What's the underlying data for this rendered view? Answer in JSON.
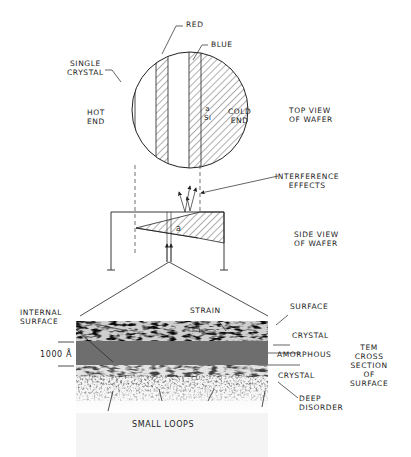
{
  "top_view": {
    "labels": {
      "red": "RED",
      "blue": "BLUE",
      "single_crystal": "SINGLE\nCRYSTAL",
      "hot_end": "HOT\nEND",
      "cold_end": "COLD\nEND",
      "alpha_si": "a\nSi",
      "caption": "TOP VIEW\nOF WAFER"
    }
  },
  "side_view": {
    "labels": {
      "interference": "INTERFERENCE\nEFFECTS",
      "alpha": "a",
      "caption": "SIDE VIEW\nOF WAFER"
    }
  },
  "tem_section": {
    "labels": {
      "internal_surface": "INTERNAL\nSURFACE",
      "strain": "STRAIN",
      "surface": "SURFACE",
      "crystal_top": "CRYSTAL",
      "amorphous": "AMORPHOUS",
      "crystal_bottom": "CRYSTAL",
      "deep_disorder": "DEEP\nDISORDER",
      "thickness": "1000 Å",
      "small_loops": "SMALL LOOPS",
      "caption": "TEM\nCROSS\nSECTION\nOF\nSURFACE"
    }
  }
}
